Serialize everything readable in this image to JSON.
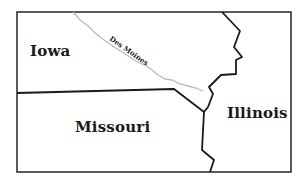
{
  "map": {
    "frame": {
      "x": 17,
      "y": 12,
      "width": 274,
      "height": 160,
      "stroke": "#333333"
    },
    "border_color": "#1a1a1a",
    "river_color": "#bbbbbb",
    "states": [
      {
        "name": "Iowa",
        "label": "Iowa",
        "x": 30,
        "y": 42
      },
      {
        "name": "Missouri",
        "label": "Missouri",
        "x": 75,
        "y": 118
      },
      {
        "name": "Illinois",
        "label": "Illinois",
        "x": 227,
        "y": 104
      }
    ],
    "rivers": [
      {
        "name": "Des Moines",
        "label": "Des Moines",
        "x": 113,
        "y": 34,
        "rotation": 35
      }
    ],
    "borders": {
      "iowa_illinois": "222,12 240,31 234,47 242,57 236,60 236,74 221,75 209,87 213,94 208,107 204,112",
      "iowa_missouri": "17,93 174,89 204,112",
      "missouri_illinois": "204,112 202,150 214,160 210,172"
    },
    "river_path": "73,12 80,20 88,26 95,33 104,40 114,47 124,53 134,60 142,64 148,67 152,70 158,75 165,79 172,80 180,84 188,86 196,88 203,91"
  }
}
